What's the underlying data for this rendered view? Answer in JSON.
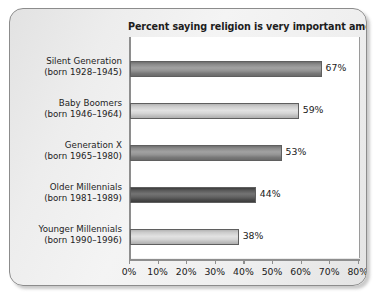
{
  "chart_data": {
    "type": "bar",
    "orientation": "horizontal",
    "title": "Percent saying religion is very important among…",
    "xlabel": "",
    "ylabel": "",
    "xlim": [
      0,
      80
    ],
    "xticks": [
      "0%",
      "10%",
      "20%",
      "30%",
      "40%",
      "50%",
      "60%",
      "70%",
      "80%"
    ],
    "xtick_values": [
      0,
      10,
      20,
      30,
      40,
      50,
      60,
      70,
      80
    ],
    "grid": false,
    "legend": "none",
    "categories": [
      "Silent Generation (born 1928–1945)",
      "Baby Boomers (born 1946–1964)",
      "Generation X (born 1965–1980)",
      "Older Millennials (born 1981–1989)",
      "Younger Millennials (born 1990–1996)"
    ],
    "values": [
      67,
      59,
      53,
      44,
      38
    ],
    "value_labels": [
      "67%",
      "59%",
      "53%",
      "44%",
      "38%"
    ],
    "bars": [
      {
        "name_line1": "Silent Generation",
        "name_line2": "(born 1928–1945)",
        "value": 67,
        "value_label": "67%",
        "shade": "dark"
      },
      {
        "name_line1": "Baby Boomers",
        "name_line2": "(born 1946–1964)",
        "value": 59,
        "value_label": "59%",
        "shade": "light"
      },
      {
        "name_line1": "Generation X",
        "name_line2": "(born 1965–1980)",
        "value": 53,
        "value_label": "53%",
        "shade": "dark"
      },
      {
        "name_line1": "Older Millennials",
        "name_line2": "(born 1981–1989)",
        "value": 44,
        "value_label": "44%",
        "shade": "darkest"
      },
      {
        "name_line1": "Younger Millennials",
        "name_line2": "(born 1990–1996)",
        "value": 38,
        "value_label": "38%",
        "shade": "light"
      }
    ],
    "colors": {
      "bar_dark": "#8a8a8a",
      "bar_light": "#cdcdcd",
      "bar_darkest": "#585858",
      "bar_outline": "#5f5f5f",
      "axis": "#8e8e8e",
      "text": "#1a1a1a",
      "plot_background": "#ffffff",
      "card_background": "#ededed",
      "card_border": "#8c8c8c"
    }
  }
}
